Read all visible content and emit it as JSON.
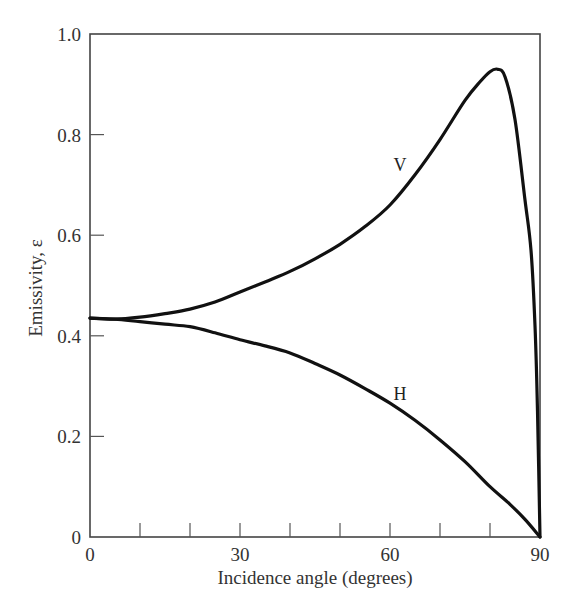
{
  "chart_data": {
    "type": "line",
    "title": "",
    "xlabel": "Incidence angle (degrees)",
    "ylabel": "Emissivity, ε",
    "xlim": [
      0,
      90
    ],
    "ylim": [
      0,
      1.0
    ],
    "x_ticks": [
      0,
      30,
      60,
      90
    ],
    "x_minor_ticks": [
      10,
      20,
      40,
      50,
      70,
      80
    ],
    "x_tick_labels": [
      "0",
      "30",
      "60",
      "90"
    ],
    "y_ticks": [
      0,
      0.2,
      0.4,
      0.6,
      0.8,
      1.0
    ],
    "y_tick_labels": [
      "0",
      "0.2",
      "0.4",
      "0.6",
      "0.8",
      "1.0"
    ],
    "grid": false,
    "legend": "none (curves labeled inline)",
    "series": [
      {
        "name": "V",
        "label": "V",
        "label_position": {
          "x": 62,
          "y": 0.74
        },
        "color": "#111111",
        "x": [
          0,
          5,
          10,
          15,
          20,
          25,
          30,
          35,
          40,
          45,
          50,
          55,
          60,
          65,
          70,
          75,
          78,
          80,
          81.5,
          83,
          85,
          87,
          88.2,
          89,
          89.5,
          90
        ],
        "y": [
          0.435,
          0.433,
          0.437,
          0.444,
          0.453,
          0.467,
          0.487,
          0.507,
          0.528,
          0.553,
          0.582,
          0.617,
          0.66,
          0.72,
          0.79,
          0.868,
          0.905,
          0.925,
          0.93,
          0.915,
          0.83,
          0.67,
          0.57,
          0.42,
          0.25,
          0.0
        ]
      },
      {
        "name": "H",
        "label": "H",
        "label_position": {
          "x": 62,
          "y": 0.285
        },
        "color": "#111111",
        "x": [
          0,
          5,
          10,
          15,
          20,
          25,
          30,
          35,
          40,
          45,
          50,
          55,
          60,
          65,
          70,
          75,
          80,
          84,
          87,
          90
        ],
        "y": [
          0.435,
          0.433,
          0.428,
          0.423,
          0.418,
          0.406,
          0.392,
          0.38,
          0.366,
          0.345,
          0.322,
          0.295,
          0.266,
          0.232,
          0.193,
          0.15,
          0.1,
          0.065,
          0.035,
          0.0
        ]
      }
    ]
  }
}
